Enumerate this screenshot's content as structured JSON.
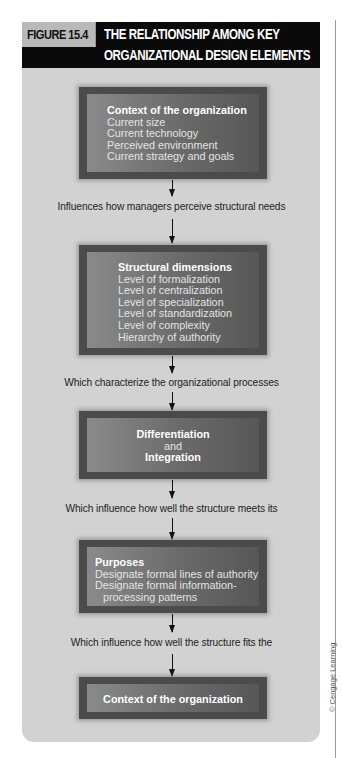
{
  "figure": {
    "label": "FIGURE 15.4",
    "title_line1": "THE RELATIONSHIP AMONG KEY",
    "title_line2": "ORGANIZATIONAL DESIGN ELEMENTS"
  },
  "boxes": {
    "context_top": {
      "title": "Context of the organization",
      "items": [
        "Current size",
        "Current technology",
        "Perceived environment",
        "Current strategy and goals"
      ]
    },
    "structural": {
      "title": "Structural dimensions",
      "items": [
        "Level of formalization",
        "Level of centralization",
        "Level of specialization",
        "Level of standardization",
        "Level of complexity",
        "Hierarchy of authority"
      ]
    },
    "diff_integ": {
      "line1": "Differentiation",
      "line2": "and",
      "line3": "Integration"
    },
    "purposes": {
      "title": "Purposes",
      "items": [
        "Designate formal lines of authority",
        "Designate formal information-",
        "processing patterns"
      ]
    },
    "context_bottom": {
      "title": "Context of the organization"
    }
  },
  "connectors": [
    "Influences how managers perceive structural needs",
    "Which characterize the organizational processes",
    "Which influence how well the structure meets its",
    "Which influence how well the structure fits the"
  ],
  "credit": "© Cengage Learning",
  "colors": {
    "header_bg": "#0a0a0a",
    "label_bg": "#b9b9b9",
    "panel_bg": "#d2d2d2",
    "box_frame": "#4b4b4b"
  }
}
